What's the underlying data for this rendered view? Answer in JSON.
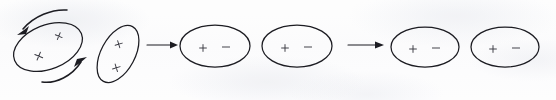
{
  "figure": {
    "title": "Dipole alignment sequence",
    "background_color": "#fdfdfd",
    "ink_color": "#1c1c22",
    "width": 556,
    "height": 100,
    "stage_arrow_glyph": "→",
    "rotation_arrow_glyph": "↻"
  },
  "stages": [
    {
      "name": "randomly-oriented",
      "label": "randomly oriented ellipses with rotation arrows",
      "ellipses": [
        {
          "name": "ellipse-1",
          "cx": 48,
          "cy": 47,
          "rx": 36,
          "ry": 22,
          "rotation": -22,
          "marks": [
            {
              "symbol": "×",
              "dx": -12,
              "dy": 5
            },
            {
              "symbol": "×",
              "dx": 14,
              "dy": -6
            }
          ]
        },
        {
          "name": "ellipse-2",
          "cx": 118,
          "cy": 54,
          "rx": 17,
          "ry": 31,
          "rotation": 28,
          "marks": [
            {
              "symbol": "×",
              "dx": -4,
              "dy": -9
            },
            {
              "symbol": "×",
              "dx": 5,
              "dy": 13
            }
          ]
        }
      ],
      "rotation_arrows": [
        {
          "name": "rotation-arrow-top-left",
          "direction": "counterclockwise"
        },
        {
          "name": "rotation-arrow-bottom-right",
          "direction": "counterclockwise"
        }
      ]
    },
    {
      "name": "partially-aligned",
      "label": "aligned ellipses with plus and minus charges",
      "ellipses": [
        {
          "name": "ellipse-3",
          "cx": 215,
          "cy": 46,
          "rx": 35,
          "ry": 21,
          "rotation": 0,
          "marks": [
            {
              "symbol": "+",
              "dx": -12,
              "dy": 2
            },
            {
              "symbol": "−",
              "dx": 11,
              "dy": 1
            }
          ]
        },
        {
          "name": "ellipse-4",
          "cx": 297,
          "cy": 46,
          "rx": 35,
          "ry": 21,
          "rotation": 0,
          "marks": [
            {
              "symbol": "+",
              "dx": -12,
              "dy": 2
            },
            {
              "symbol": "−",
              "dx": 11,
              "dy": 1
            }
          ]
        }
      ],
      "rotation_arrows": []
    },
    {
      "name": "fully-aligned",
      "label": "fully aligned ellipses with plus and minus charges",
      "ellipses": [
        {
          "name": "ellipse-5",
          "cx": 425,
          "cy": 47,
          "rx": 34,
          "ry": 20,
          "rotation": 0,
          "marks": [
            {
              "symbol": "+",
              "dx": -12,
              "dy": 2
            },
            {
              "symbol": "−",
              "dx": 11,
              "dy": 1
            }
          ]
        },
        {
          "name": "ellipse-6",
          "cx": 505,
          "cy": 47,
          "rx": 34,
          "ry": 20,
          "rotation": 0,
          "marks": [
            {
              "symbol": "+",
              "dx": -12,
              "dy": 2
            },
            {
              "symbol": "−",
              "dx": 11,
              "dy": 1
            }
          ]
        }
      ],
      "rotation_arrows": []
    }
  ],
  "transition_arrows": [
    {
      "name": "transition-arrow-1",
      "x1": 147,
      "y1": 45,
      "x2": 177,
      "y2": 45
    },
    {
      "name": "transition-arrow-2",
      "x1": 348,
      "y1": 45,
      "x2": 383,
      "y2": 45
    }
  ],
  "symbols": {
    "cross": "×",
    "plus": "+",
    "minus": "−"
  }
}
